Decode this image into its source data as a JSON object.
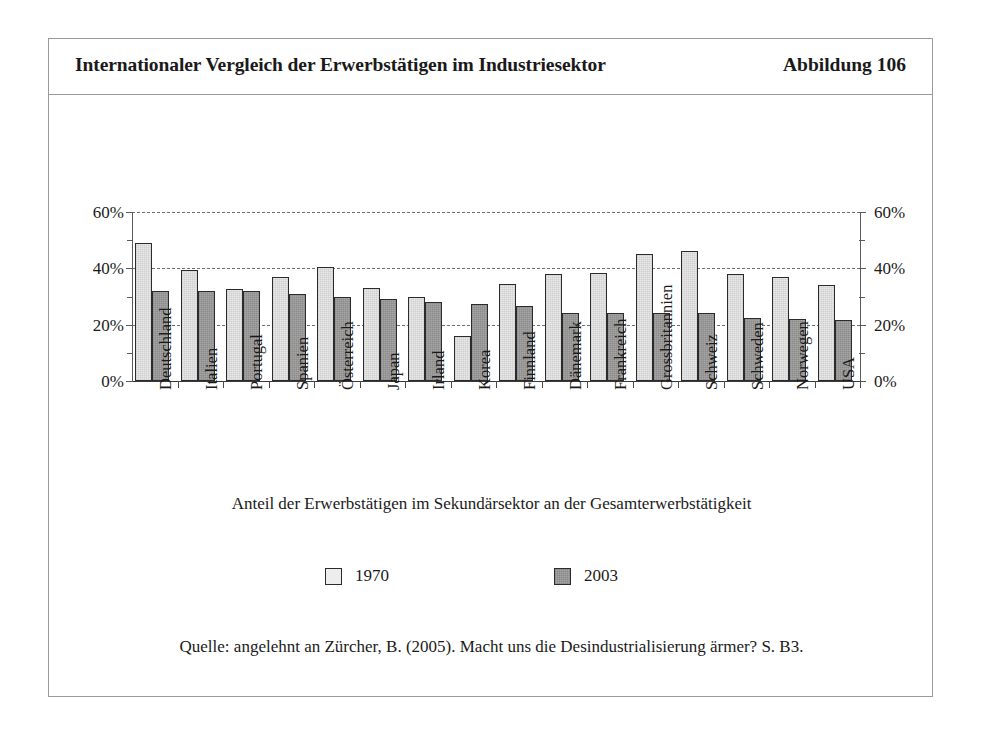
{
  "figure": {
    "title": "Internationaler Vergleich der Erwerbstätigen im Industriesektor",
    "number": "Abbildung 106",
    "axis_caption": "Anteil der Erwerbstätigen im Sekundärsektor an der Gesamterwerbstätigkeit",
    "source": "Quelle: angelehnt an Zürcher, B. (2005). Macht uns die Desindustrialisierung ärmer? S. B3."
  },
  "colors": {
    "series_1970": "#ededed",
    "series_2003": "#a5a5a5",
    "bar_outline": "#2b2b2b",
    "frame_border": "#9a9a9a",
    "gridline": "#6f6f6f",
    "text": "#1a1a1a"
  },
  "legend": {
    "position": "bottom",
    "items": [
      {
        "label": "1970",
        "swatch": "light-checker-swatch"
      },
      {
        "label": "2003",
        "swatch": "dark-checker-swatch"
      }
    ]
  },
  "chart_data": {
    "type": "bar",
    "title": "Internationaler Vergleich der Erwerbstätigen im Industriesektor",
    "subtitle": "Anteil der Erwerbstätigen im Sekundärsektor an der Gesamterwerbstätigkeit",
    "xlabel": "",
    "ylabel": "",
    "ylim": [
      0,
      60
    ],
    "ytick_labels": [
      "0%",
      "20%",
      "40%",
      "60%"
    ],
    "ytick_values": [
      0,
      20,
      40,
      60
    ],
    "yminor_tick_values": [
      10,
      30,
      50
    ],
    "grid": "horizontal-dashed",
    "dual_axis": true,
    "categories": [
      "Deutschland",
      "Italien",
      "Portugal",
      "Spanien",
      "Österreich",
      "Japan",
      "Irland",
      "Korea",
      "Finnland",
      "Dänemark",
      "Frankreich",
      "Grossbritannien",
      "Schweiz",
      "Schweden",
      "Norwegen",
      "USA"
    ],
    "series": [
      {
        "name": "1970",
        "values": [
          49.0,
          39.5,
          32.5,
          37.0,
          40.5,
          33.0,
          30.0,
          16.0,
          34.5,
          38.0,
          38.5,
          45.0,
          46.0,
          38.0,
          37.0,
          34.0
        ]
      },
      {
        "name": "2003",
        "values": [
          32.0,
          32.0,
          32.0,
          31.0,
          30.0,
          29.0,
          28.0,
          27.5,
          26.5,
          24.0,
          24.0,
          24.0,
          24.0,
          22.5,
          22.0,
          21.5
        ]
      }
    ]
  }
}
